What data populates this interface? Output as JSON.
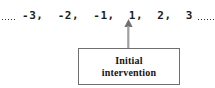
{
  "figure": {
    "background_color": "#ffffff",
    "line_color": "#2b2b2b",
    "box_border_color": "#6f6f6f",
    "text_color": "#141414"
  },
  "timeline": {
    "leading_ellipsis": "........",
    "trailing_ellipsis": "........",
    "sequence_text": "-3,  -2,  -1,  1,  2,  3",
    "points": [
      "-3",
      "-2",
      "-1",
      "1",
      "2",
      "3"
    ],
    "separator": ",",
    "marked_point": "1"
  },
  "arrow": {
    "icon": "arrow-up-icon",
    "direction": "up",
    "points_to": "1",
    "color": "#8a8a8a"
  },
  "callout": {
    "line1": "Initial",
    "line2": "intervention",
    "full_label": "Initial intervention"
  }
}
